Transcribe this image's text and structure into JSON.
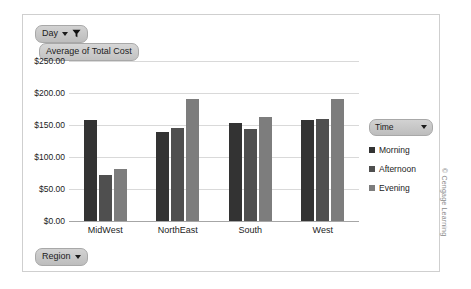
{
  "filter": {
    "day_label": "Day",
    "dropdown_icon": "chevron-down-icon",
    "funnel_icon": "filter-funnel-icon"
  },
  "value_field": {
    "label": "Average of Total Cost"
  },
  "row_field": {
    "label": "Region",
    "dropdown_icon": "chevron-down-icon"
  },
  "legend": {
    "title": "Time",
    "dropdown_icon": "chevron-down-icon",
    "items": [
      {
        "label": "Morning",
        "color": "#333333"
      },
      {
        "label": "Afternoon",
        "color": "#4f4f4f"
      },
      {
        "label": "Evening",
        "color": "#7d7d7d"
      }
    ]
  },
  "credit": "© Cengage Learning",
  "colors": {
    "frame_border": "#cfcfcf",
    "gridline": "#d9d9d9",
    "axis": "#a6a6a6",
    "pill_face": "#c9c9c9",
    "text": "#1c1c1c"
  },
  "chart_data": {
    "type": "bar",
    "title": "Average of Total Cost",
    "xlabel": "Region",
    "ylabel": "",
    "categories": [
      "MidWest",
      "NorthEast",
      "South",
      "West"
    ],
    "ylim": [
      0,
      250
    ],
    "ytick_values": [
      0,
      50,
      100,
      150,
      200,
      250
    ],
    "ytick_labels": [
      "$0.00",
      "$50.00",
      "$100.00",
      "$150.00",
      "$200.00",
      "$250.00"
    ],
    "grid": true,
    "legend_position": "right",
    "series": [
      {
        "name": "Morning",
        "color": "#333333",
        "values": [
          158,
          139,
          153,
          158
        ]
      },
      {
        "name": "Afternoon",
        "color": "#4f4f4f",
        "values": [
          72,
          146,
          144,
          159
        ]
      },
      {
        "name": "Evening",
        "color": "#7d7d7d",
        "values": [
          82,
          191,
          163,
          191
        ]
      }
    ]
  }
}
